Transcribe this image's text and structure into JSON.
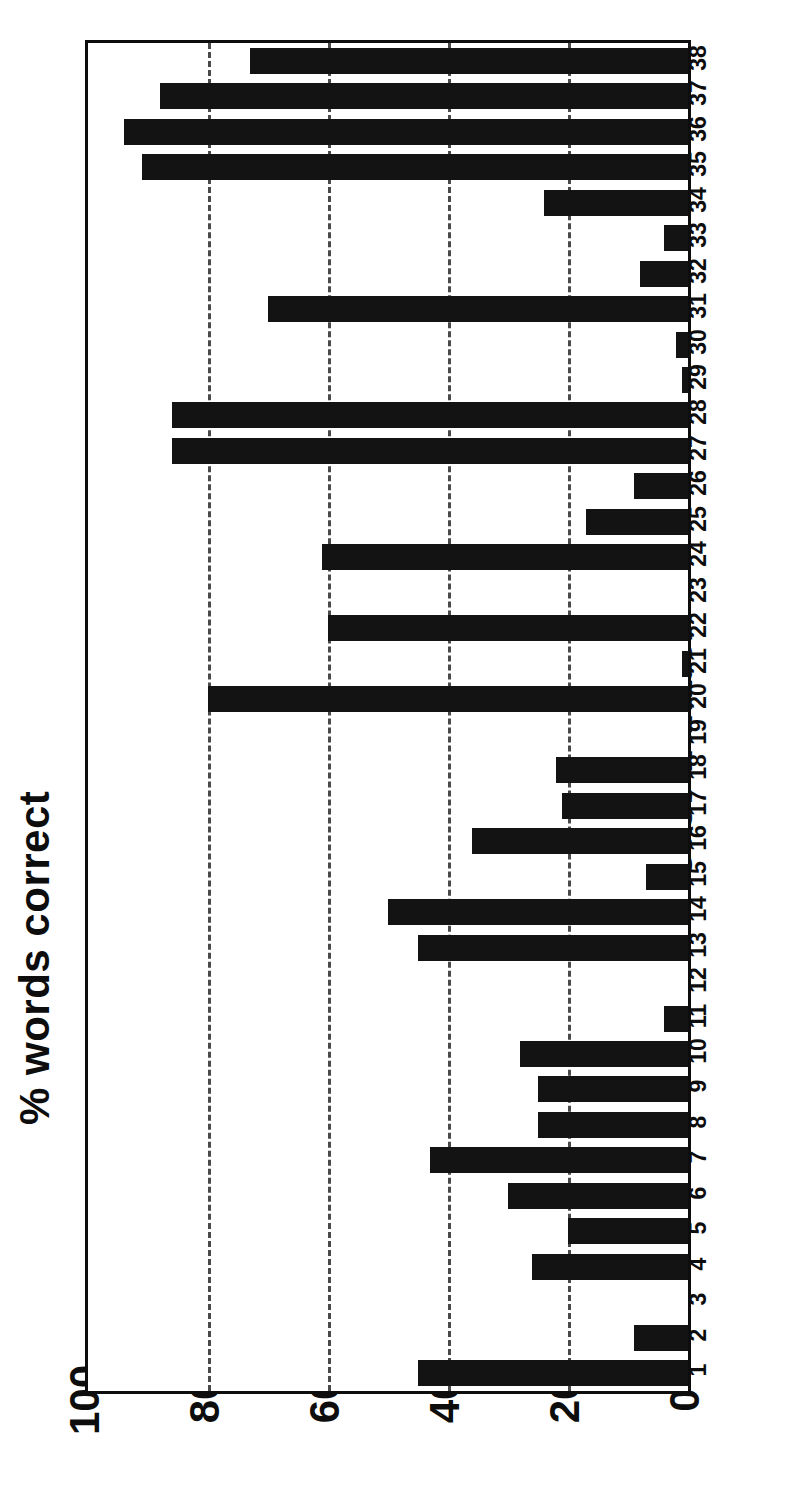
{
  "chart_data": {
    "type": "bar",
    "orientation": "horizontal",
    "rotated_figure": true,
    "title": "",
    "xlabel": "Case number",
    "ylabel": "% words correct",
    "value_axis_label": "% words correct",
    "category_axis_label": "Case number",
    "value_ticks": [
      "100",
      "80",
      "60",
      "40",
      "20",
      "0"
    ],
    "value_tick_values": [
      100,
      80,
      60,
      40,
      20,
      0
    ],
    "ylim": [
      0,
      100
    ],
    "grid": "dotted vertical gridlines at 20, 40, 60, 80",
    "grid_values": [
      80,
      60,
      40,
      20
    ],
    "legend": "none",
    "bar_color": "#131313",
    "axis_color": "#0d0d0d",
    "background_color": "#ffffff",
    "categories": [
      "1",
      "2",
      "3",
      "4",
      "5",
      "6",
      "7",
      "8",
      "9",
      "10",
      "11",
      "12",
      "13",
      "14",
      "15",
      "16",
      "17",
      "18",
      "19",
      "20",
      "21",
      "22",
      "23",
      "24",
      "25",
      "26",
      "27",
      "28",
      "29",
      "30",
      "31",
      "32",
      "33",
      "34",
      "35",
      "36",
      "37",
      "38"
    ],
    "values": [
      45,
      9,
      0,
      26,
      20,
      30,
      43,
      25,
      25,
      28,
      4,
      0,
      45,
      50,
      7,
      36,
      21,
      22,
      0,
      80,
      1,
      60,
      0,
      61,
      17,
      9,
      86,
      86,
      1,
      2,
      70,
      8,
      4,
      24,
      91,
      94,
      88,
      73
    ],
    "series": [
      {
        "name": "% words correct",
        "values": [
          45,
          9,
          0,
          26,
          20,
          30,
          43,
          25,
          25,
          28,
          4,
          0,
          45,
          50,
          7,
          36,
          21,
          22,
          0,
          80,
          1,
          60,
          0,
          61,
          17,
          9,
          86,
          86,
          1,
          2,
          70,
          8,
          4,
          24,
          91,
          94,
          88,
          73
        ]
      }
    ]
  }
}
